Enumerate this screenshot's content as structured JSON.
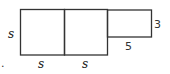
{
  "diagram": {
    "labels": {
      "left_side": "s",
      "bottom_left": "s",
      "bottom_middle": "s",
      "rect_height": "3",
      "rect_width": "5",
      "marker": "."
    },
    "stroke_color": "#333333"
  }
}
